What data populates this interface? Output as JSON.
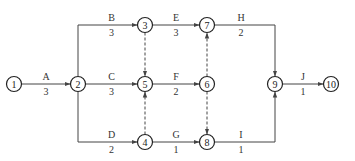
{
  "diagram": {
    "type": "activity-on-arrow network",
    "nodes": [
      {
        "id": "1",
        "label": "1",
        "x": 14,
        "y": 84
      },
      {
        "id": "2",
        "label": "2",
        "x": 78,
        "y": 84
      },
      {
        "id": "3",
        "label": "3",
        "x": 145,
        "y": 25
      },
      {
        "id": "4",
        "label": "4",
        "x": 145,
        "y": 142
      },
      {
        "id": "5",
        "label": "5",
        "x": 145,
        "y": 84
      },
      {
        "id": "6",
        "label": "6",
        "x": 207,
        "y": 84
      },
      {
        "id": "7",
        "label": "7",
        "x": 207,
        "y": 25
      },
      {
        "id": "8",
        "label": "8",
        "x": 207,
        "y": 142
      },
      {
        "id": "9",
        "label": "9",
        "x": 275,
        "y": 84
      },
      {
        "id": "10",
        "label": "10",
        "x": 331,
        "y": 84
      }
    ],
    "activities": [
      {
        "name": "A",
        "duration": "3",
        "from": "1",
        "to": "2"
      },
      {
        "name": "B",
        "duration": "3",
        "from": "2",
        "to": "3"
      },
      {
        "name": "C",
        "duration": "3",
        "from": "2",
        "to": "5"
      },
      {
        "name": "D",
        "duration": "2",
        "from": "2",
        "to": "4"
      },
      {
        "name": "E",
        "duration": "3",
        "from": "3",
        "to": "7"
      },
      {
        "name": "F",
        "duration": "2",
        "from": "5",
        "to": "6"
      },
      {
        "name": "G",
        "duration": "1",
        "from": "4",
        "to": "8"
      },
      {
        "name": "H",
        "duration": "2",
        "from": "7",
        "to": "9"
      },
      {
        "name": "I",
        "duration": "1",
        "from": "8",
        "to": "9"
      },
      {
        "name": "J",
        "duration": "1",
        "from": "9",
        "to": "10"
      }
    ],
    "dummies": [
      {
        "from": "3",
        "to": "5"
      },
      {
        "from": "4",
        "to": "5"
      },
      {
        "from": "6",
        "to": "7"
      },
      {
        "from": "6",
        "to": "8"
      }
    ],
    "colors": {
      "line": "#444444",
      "node": "#222222",
      "background": "#ffffff"
    }
  }
}
